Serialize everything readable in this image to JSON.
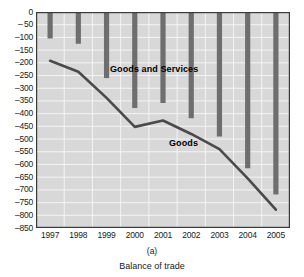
{
  "chart_data": {
    "type": "bar",
    "title": "",
    "subtitle": "",
    "xlabel": "",
    "ylabel": "",
    "categories": [
      "1997",
      "1998",
      "1999",
      "2000",
      "2001",
      "2002",
      "2003",
      "2004",
      "2005"
    ],
    "ylim": [
      -850,
      0
    ],
    "ytick_step": 50,
    "yticks": [
      0,
      -50,
      -100,
      -150,
      -200,
      -250,
      -300,
      -350,
      -400,
      -450,
      -500,
      -550,
      -600,
      -650,
      -700,
      -750,
      -800,
      -850
    ],
    "ytick_labels": [
      "0",
      "– 50",
      "–100",
      "–150",
      "–200",
      "–250",
      "–300",
      "–350",
      "–400",
      "–450",
      "–500",
      "–550",
      "–600",
      "–650",
      "–700",
      "–750",
      "–800",
      "–850"
    ],
    "grid": true,
    "legend_position": "inline-annotation",
    "series": [
      {
        "name": "Goods and Services",
        "render": "bar",
        "color": "#6e6e6e",
        "values": [
          -104,
          -125,
          -260,
          -378,
          -358,
          -418,
          -490,
          -615,
          -718
        ]
      },
      {
        "name": "Goods",
        "render": "line",
        "color": "#4a4a4a",
        "values": [
          -192,
          -235,
          -338,
          -452,
          -427,
          -480,
          -540,
          -655,
          -778
        ]
      }
    ],
    "annotations": [
      {
        "text": "Goods and Services",
        "series": "Goods and Services"
      },
      {
        "text": "Goods",
        "series": "Goods"
      }
    ],
    "caption_a": "(a)",
    "caption_main": "Balance of trade"
  },
  "colors": {
    "plot_background": "#d8d8d8",
    "grid_line": "#f4f4f4",
    "plot_border": "#3a3a3a",
    "bar": "#6e6e6e",
    "line": "#4a4a4a",
    "text": "#1b1b1b"
  }
}
